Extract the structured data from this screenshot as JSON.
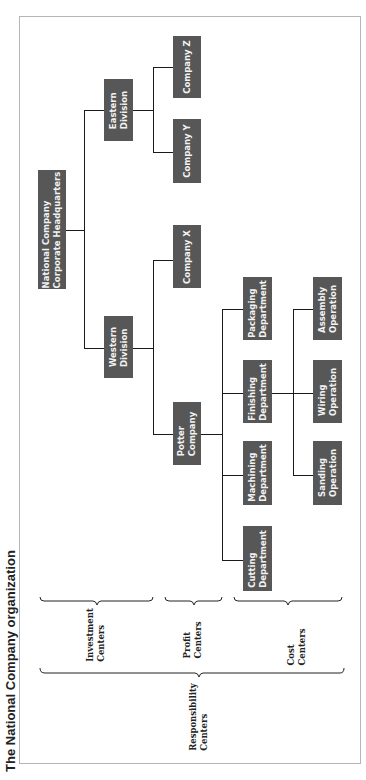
{
  "title": "The National Company organization",
  "colors": {
    "box_fill": "#575757",
    "box_text": "#f2f2f2",
    "line": "#1a1a1a",
    "frame": "#b5b5b5"
  },
  "nodes": {
    "hq": {
      "line1": "National Company",
      "line2": "Corporate Headquarters"
    },
    "eastern": {
      "line1": "Eastern",
      "line2": "Division"
    },
    "western": {
      "line1": "Western",
      "line2": "Division"
    },
    "company_z": {
      "line1": "Company Z"
    },
    "company_y": {
      "line1": "Company Y"
    },
    "company_x": {
      "line1": "Company X"
    },
    "potter": {
      "line1": "Potter",
      "line2": "Company"
    },
    "packaging": {
      "line1": "Packaging",
      "line2": "Department"
    },
    "finishing": {
      "line1": "Finishing",
      "line2": "Department"
    },
    "machining": {
      "line1": "Machining",
      "line2": "Department"
    },
    "cutting": {
      "line1": "Cutting",
      "line2": "Department"
    },
    "assembly": {
      "line1": "Assembly",
      "line2": "Operation"
    },
    "wiring": {
      "line1": "Wiring",
      "line2": "Operation"
    },
    "sanding": {
      "line1": "Sanding",
      "line2": "Operation"
    }
  },
  "legend": {
    "investment": {
      "line1": "Investment",
      "line2": "Centers"
    },
    "profit": {
      "line1": "Profit",
      "line2": "Centers"
    },
    "cost": {
      "line1": "Cost",
      "line2": "Centers"
    },
    "responsibility": {
      "line1": "Responsibility",
      "line2": "Centers"
    }
  }
}
